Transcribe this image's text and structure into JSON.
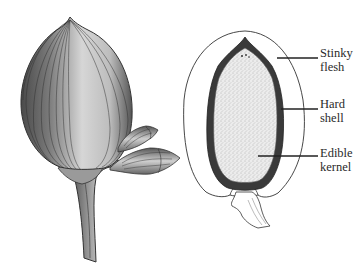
{
  "figure": {
    "type": "botanical-illustration",
    "left_panel": {
      "subject": "whole-fruit-with-buds"
    },
    "right_panel": {
      "subject": "fruit-cross-section"
    }
  },
  "labels": [
    {
      "id": "stinky-flesh",
      "line1": "Stinky",
      "line2": "flesh"
    },
    {
      "id": "hard-shell",
      "line1": "Hard",
      "line2": "shell"
    },
    {
      "id": "edible-kernel",
      "line1": "Edible",
      "line2": "kernel"
    }
  ],
  "colors": {
    "ink": "#2a2a2a",
    "shell": "#3a3a3a",
    "kernel_fill": "#e4e4e4",
    "fruit_light": "#d8d8d8",
    "background": "#ffffff"
  }
}
